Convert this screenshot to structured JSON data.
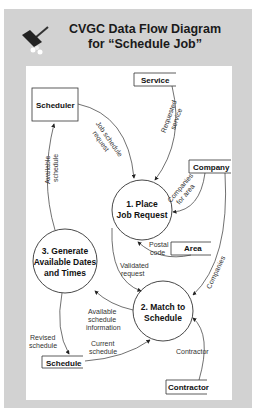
{
  "title": {
    "line1": "CVGC Data Flow Diagram",
    "line2": "for “Schedule Job”"
  },
  "icon": "broom-icon",
  "entities": {
    "scheduler": "Scheduler",
    "service": "Service",
    "company": "Company",
    "area": "Area",
    "schedule": "Schedule",
    "contractor": "Contractor"
  },
  "processes": {
    "p1": {
      "line1": "1. Place",
      "line2": "Job Request"
    },
    "p2": {
      "line1": "2. Match to",
      "line2": "Schedule"
    },
    "p3": {
      "line1": "3. Generate",
      "line2": "Available Dates",
      "line3": "and Times"
    }
  },
  "flows": {
    "job_schedule_request": {
      "l1": "Job schedule",
      "l2": "request"
    },
    "requested_service": {
      "l1": "Requested",
      "l2": "service"
    },
    "available_schedule": {
      "l1": "Available",
      "l2": "schedule"
    },
    "companies_for_area": {
      "l1": "Companies",
      "l2": "for area"
    },
    "postal_code": {
      "l1": "Postal",
      "l2": "code"
    },
    "validated_request": {
      "l1": "Validated",
      "l2": "request"
    },
    "companies": "Companies",
    "available_schedule_information": {
      "l1": "Available",
      "l2": "schedule",
      "l3": "information"
    },
    "revised_schedule": {
      "l1": "Revised",
      "l2": "schedule"
    },
    "current_schedule": {
      "l1": "Current",
      "l2": "schedule"
    },
    "contractor": "Contractor"
  }
}
